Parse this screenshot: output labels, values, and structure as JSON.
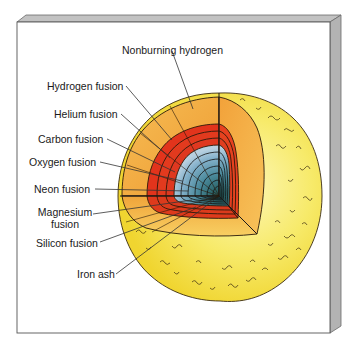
{
  "diagram": {
    "labels": [
      {
        "id": "nonburning-hydrogen",
        "text": "Nonburning hydrogen",
        "x": 122,
        "y": 38,
        "line": [
          172,
          51,
          193,
          109
        ]
      },
      {
        "id": "hydrogen-fusion",
        "text": "Hydrogen fusion",
        "x": 47,
        "y": 77,
        "line": [
          126,
          86,
          172,
          140
        ]
      },
      {
        "id": "helium-fusion",
        "text": "Helium fusion",
        "x": 54,
        "y": 105,
        "line": [
          121,
          114,
          170,
          158
        ]
      },
      {
        "id": "carbon-fusion",
        "text": "Carbon fusion",
        "x": 39,
        "y": 130,
        "line": [
          107,
          139,
          175,
          172
        ]
      },
      {
        "id": "oxygen-fusion",
        "text": "Oxygen fusion",
        "x": 30,
        "y": 153,
        "line": [
          100,
          162,
          182,
          181
        ]
      },
      {
        "id": "neon-fusion",
        "text": "Neon fusion",
        "x": 35,
        "y": 181,
        "line": [
          95,
          189,
          188,
          191
        ]
      },
      {
        "id": "magnesium-fusion",
        "text": [
          "Magnesium",
          "fusion"
        ],
        "x": 36,
        "y": 204,
        "line": [
          93,
          214,
          192,
          200
        ]
      },
      {
        "id": "silicon-fusion",
        "text": "Silicon fusion",
        "x": 37,
        "y": 236,
        "line": [
          100,
          242,
          196,
          207
        ]
      },
      {
        "id": "iron-ash",
        "text": "Iron ash",
        "x": 77,
        "y": 267,
        "line": [
          116,
          274,
          214,
          200
        ]
      }
    ]
  },
  "colors": {
    "frame_face": "#ffffff",
    "frame_bevel": "#b9b9b9",
    "frame_bevel_dark": "#a4a4a4",
    "frame_edge": "#555555",
    "photosphere": "#f4e34a",
    "photosphere_light": "#fbf39a",
    "nonburning": "#f2a53a",
    "nonburning_light": "#f7c56a",
    "burning_red": "#e0301c",
    "burning_red_light": "#ea4a26",
    "core_light": "#a9c7dc",
    "core_mid": "#5c93a8",
    "core_dark": "#1f5a55",
    "outline": "#2a1a0a"
  }
}
